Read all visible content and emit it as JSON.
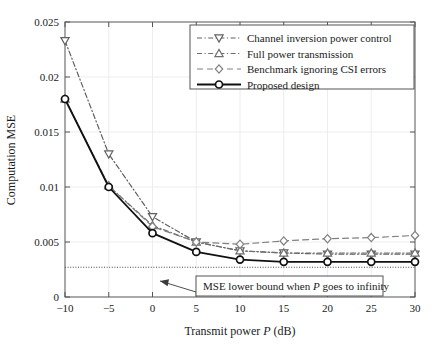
{
  "chart_data": {
    "type": "line",
    "title": "",
    "xlabel": "Transmit power P (dB)",
    "ylabel": "Computation MSE",
    "x": [
      -10,
      -5,
      0,
      5,
      10,
      15,
      20,
      25,
      30
    ],
    "xlim": [
      -10,
      30
    ],
    "ylim": [
      0,
      0.025
    ],
    "xticks": [
      "−10",
      "−5",
      "0",
      "5",
      "10",
      "15",
      "20",
      "25",
      "30"
    ],
    "yticks": [
      "0",
      "0.005",
      "0.01",
      "0.015",
      "0.02",
      "0.025"
    ],
    "ytick_values": [
      0,
      0.005,
      0.01,
      0.015,
      0.02,
      0.025
    ],
    "grid": true,
    "legend_position": "top-right",
    "series": [
      {
        "name": "Channel inversion power control",
        "marker": "triangle-down",
        "linestyle": "dashdot",
        "color": "#606060",
        "values": [
          0.0233,
          0.013,
          0.0073,
          0.005,
          0.0042,
          0.004,
          0.0039,
          0.0039,
          0.0039
        ]
      },
      {
        "name": "Full power transmission",
        "marker": "triangle-up",
        "linestyle": "dashdot",
        "color": "#6e6e6e",
        "values": [
          0.018,
          0.0101,
          0.0065,
          0.005,
          0.0042,
          0.004,
          0.004,
          0.004,
          0.004
        ]
      },
      {
        "name": "Benchmark ignoring CSI errors",
        "marker": "diamond",
        "linestyle": "dashed",
        "color": "#808080",
        "values": [
          0.018,
          0.0101,
          0.0064,
          0.005,
          0.0048,
          0.0051,
          0.0053,
          0.0054,
          0.0056
        ]
      },
      {
        "name": "Proposed design",
        "marker": "circle",
        "linestyle": "solid",
        "color": "#111111",
        "values": [
          0.018,
          0.01,
          0.0058,
          0.0041,
          0.0034,
          0.0032,
          0.0032,
          0.0032,
          0.0032
        ]
      }
    ],
    "reference_line": {
      "label": "MSE lower bound when P goes to infinity",
      "value": 0.0027,
      "linestyle": "dotted"
    },
    "annotations": [
      {
        "text_prefix": "MSE lower bound when ",
        "text_italic": "P",
        "text_suffix": " goes to infinity"
      }
    ]
  },
  "axes": {
    "x_title_prefix": "Transmit power ",
    "x_title_italic": "P",
    "x_title_suffix": " (dB)",
    "y_title": "Computation MSE"
  }
}
